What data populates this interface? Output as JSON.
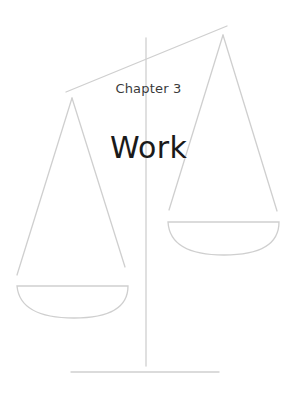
{
  "chapter": {
    "label": "Chapter 3",
    "title": "Work"
  },
  "illustration": {
    "name": "balance-scale",
    "stroke_color": "#cfcfcf"
  },
  "colors": {
    "background": "#ffffff",
    "label_text": "#3a3a3a",
    "title_text": "#1a1a1a",
    "line_art": "#cfcfcf"
  }
}
